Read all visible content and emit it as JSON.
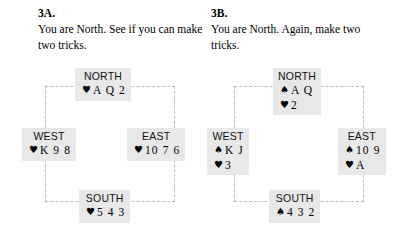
{
  "problems": [
    {
      "id": "3A",
      "label": "3A.",
      "prompt": "You are North. See if you can make two tricks.",
      "hands": {
        "north": {
          "name": "NORTH",
          "suits": [
            {
              "symbol": "♥",
              "suit": "hearts",
              "cards": "A Q 2"
            }
          ]
        },
        "west": {
          "name": "WEST",
          "suits": [
            {
              "symbol": "♥",
              "suit": "hearts",
              "cards": "K 9 8"
            }
          ]
        },
        "east": {
          "name": "EAST",
          "suits": [
            {
              "symbol": "♥",
              "suit": "hearts",
              "cards": "10 7 6"
            }
          ]
        },
        "south": {
          "name": "SOUTH",
          "suits": [
            {
              "symbol": "♥",
              "suit": "hearts",
              "cards": "5 4 3"
            }
          ]
        }
      }
    },
    {
      "id": "3B",
      "label": "3B.",
      "prompt": "You are North. Again, make two tricks.",
      "hands": {
        "north": {
          "name": "NORTH",
          "suits": [
            {
              "symbol": "♠",
              "suit": "spades",
              "cards": "A Q"
            },
            {
              "symbol": "♥",
              "suit": "hearts",
              "cards": "2"
            }
          ]
        },
        "west": {
          "name": "WEST",
          "suits": [
            {
              "symbol": "♠",
              "suit": "spades",
              "cards": "K J"
            },
            {
              "symbol": "♥",
              "suit": "hearts",
              "cards": "3"
            }
          ]
        },
        "east": {
          "name": "EAST",
          "suits": [
            {
              "symbol": "♠",
              "suit": "spades",
              "cards": "10 9"
            },
            {
              "symbol": "♥",
              "suit": "hearts",
              "cards": "A"
            }
          ]
        },
        "south": {
          "name": "SOUTH",
          "suits": [
            {
              "symbol": "♠",
              "suit": "spades",
              "cards": "4 3 2"
            }
          ]
        }
      }
    }
  ],
  "colors": {
    "hand_box_background": "#e8e8e8",
    "frame_line": "#b9b9b9",
    "text": "#000000",
    "page_background": "#ffffff"
  }
}
